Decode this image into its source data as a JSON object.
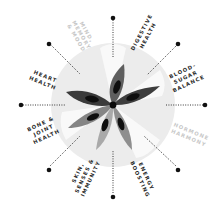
{
  "diagram": {
    "center": {
      "x": 113,
      "y": 105
    },
    "colors": {
      "background": "#ffffff",
      "halo": "#ebebeb",
      "halo_inner": "#f4f4f4",
      "petal_dark": "#3a3a3a",
      "petal_mid": "#8a8a8a",
      "petal_light": "#b4b4b4",
      "seed": "#0e0e0e",
      "dot": "#111111",
      "label_active": "#2a2a2a",
      "label_faded": "#c8c8c8"
    },
    "spokes": [
      {
        "id": "mind",
        "lines": [
          "MIND,",
          "MEMORY",
          "& MOOD"
        ],
        "angle": -90,
        "faded": true
      },
      {
        "id": "digestive",
        "lines": [
          "DIGESTIVE",
          "HEALTH"
        ],
        "angle": -45,
        "faded": false
      },
      {
        "id": "blood-sugar",
        "lines": [
          "BLOOD-",
          "SUGAR",
          "BALANCE"
        ],
        "angle": 0,
        "faded": false
      },
      {
        "id": "hormone",
        "lines": [
          "HORMONE",
          "HARMONY"
        ],
        "angle": 45,
        "faded": true
      },
      {
        "id": "energy",
        "lines": [
          "ENERGY",
          "BOOSTING"
        ],
        "angle": 90,
        "faded": false
      },
      {
        "id": "skin",
        "lines": [
          "SKIN,",
          "SENSES &",
          "IMMUNITY"
        ],
        "angle": 135,
        "faded": false
      },
      {
        "id": "bone",
        "lines": [
          "BONE &",
          "JOINT",
          "HEALTH"
        ],
        "angle": 180,
        "faded": false
      },
      {
        "id": "heart",
        "lines": [
          "HEART",
          "HEALTH"
        ],
        "angle": -135,
        "faded": false
      }
    ],
    "labels": {
      "mind_1": "MIND,",
      "mind_2": "MEMORY",
      "mind_3": "& MOOD",
      "digestive_1": "DIGESTIVE",
      "digestive_2": "HEALTH",
      "blood_1": "BLOOD-",
      "blood_2": "SUGAR",
      "blood_3": "BALANCE",
      "hormone_1": "HORMONE",
      "hormone_2": "HARMONY",
      "energy_1": "ENERGY",
      "energy_2": "BOOSTING",
      "skin_1": "SKIN,",
      "skin_2": "SENSES &",
      "skin_3": "IMMUNITY",
      "bone_1": "BONE &",
      "bone_2": "JOINT",
      "bone_3": "HEALTH",
      "heart_1": "HEART",
      "heart_2": "HEALTH"
    }
  }
}
